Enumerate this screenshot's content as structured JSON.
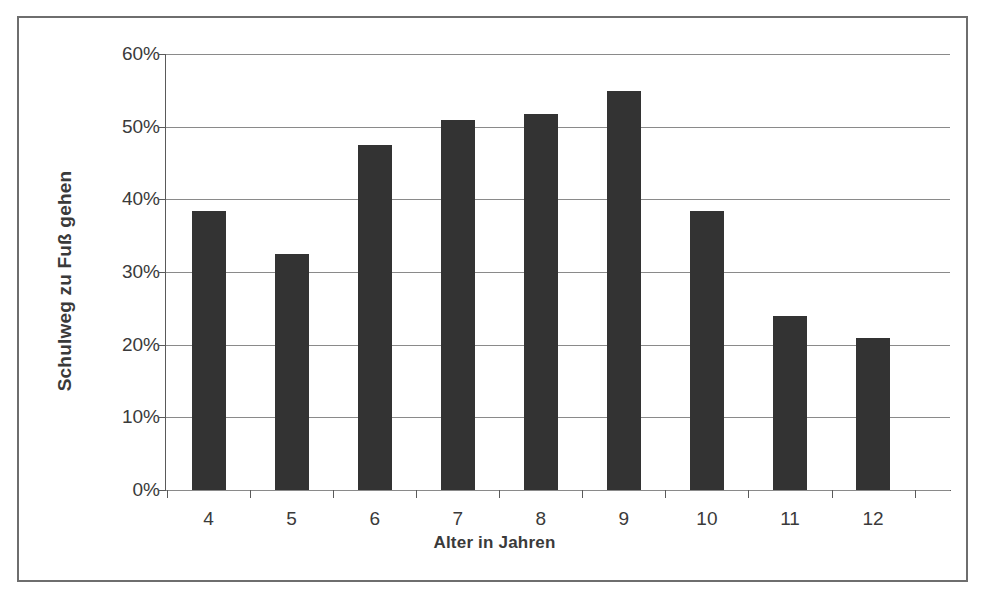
{
  "figure": {
    "border_color": "#6e6e6e",
    "background": "#ffffff"
  },
  "chart_data": {
    "type": "bar",
    "title": "",
    "xlabel": "Alter in Jahren",
    "ylabel": "Schulweg zu Fuß gehen",
    "categories": [
      "4",
      "5",
      "6",
      "7",
      "8",
      "9",
      "10",
      "11",
      "12"
    ],
    "values": [
      38.4,
      32.5,
      47.5,
      50.9,
      51.8,
      54.9,
      38.4,
      24.0,
      20.9
    ],
    "ylim": [
      0,
      60
    ],
    "ytick_values": [
      0,
      10,
      20,
      30,
      40,
      50,
      60
    ],
    "ytick_labels": [
      "0%",
      "10%",
      "20%",
      "30%",
      "40%",
      "50%",
      "60%"
    ],
    "grid": true,
    "grid_axis": "y",
    "legend": false,
    "bar_color": "#333333",
    "gridline_color": "#8a8a8a",
    "axis_color": "#5a5a5a",
    "value_format": "percent"
  }
}
